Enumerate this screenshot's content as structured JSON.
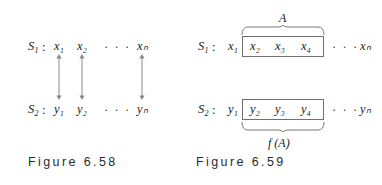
{
  "page": {
    "background": "#ffffff",
    "ink": "#191919",
    "rule_color": "#6f6f6f"
  },
  "figures": [
    {
      "id": "figure-6-58",
      "caption": "Figure 6.58",
      "rows": [
        {
          "set_label": "S",
          "set_index": "1",
          "separator": ":",
          "elements": [
            "x₁",
            "x₂",
            "xₙ"
          ],
          "ellipsis": "· · ·"
        },
        {
          "set_label": "S",
          "set_index": "2",
          "separator": ":",
          "elements": [
            "y₁",
            "y₂",
            "yₙ"
          ],
          "ellipsis": "· · ·"
        }
      ],
      "correspondence": {
        "arrow_type": "double-headed-vertical",
        "count": 3,
        "meaning": "one-to-one correspondence between S1 and S2"
      }
    },
    {
      "id": "figure-6-59",
      "caption": "Figure 6.59",
      "top_brace_label": "A",
      "bottom_brace_label": "f (A)",
      "rows": [
        {
          "set_label": "S",
          "set_index": "1",
          "separator": ":",
          "outside_left": "x₁",
          "boxed": [
            "x₂",
            "x₃",
            "x₄"
          ],
          "ellipsis": "· · ·",
          "outside_right": "xₙ"
        },
        {
          "set_label": "S",
          "set_index": "2",
          "separator": ":",
          "outside_left": "y₁",
          "boxed": [
            "y₂",
            "y₃",
            "y₄"
          ],
          "ellipsis": "· · ·",
          "outside_right": "yₙ"
        }
      ]
    }
  ]
}
